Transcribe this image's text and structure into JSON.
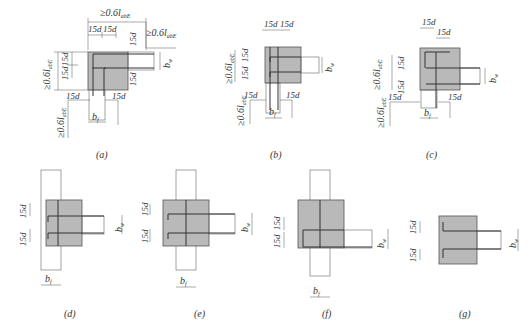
{
  "figure": {
    "panels": [
      {
        "id": "a",
        "caption": "(a)",
        "labels": {
          "top_anchor": "≥0.6l",
          "top_anchor_sub": "abE",
          "right_anchor": "≥0.6l",
          "right_anchor_sub": "abE",
          "left_anchor": "≥0.6l",
          "left_anchor_sub": "abE",
          "bottom_anchor": "≥0.6l",
          "bottom_anchor_sub": "abE",
          "hook": "15d",
          "bw": "b",
          "bw_sub": "w",
          "bf": "b",
          "bf_sub": "f"
        }
      },
      {
        "id": "b",
        "caption": "(b)",
        "labels": {
          "left_anchor": "≥0.6l",
          "left_anchor_sub": "abE",
          "bottom_anchor": "≥0.6l",
          "bottom_anchor_sub": "abE",
          "hook": "15d",
          "bw": "b",
          "bw_sub": "w",
          "bf": "b",
          "bf_sub": "f"
        }
      },
      {
        "id": "c",
        "caption": "(c)",
        "labels": {
          "left_anchor": "≥0.6l",
          "left_anchor_sub": "abE",
          "bottom_anchor": "≥0.6l",
          "bottom_anchor_sub": "abE",
          "hook": "15d",
          "bw": "b",
          "bw_sub": "w",
          "bf": "b",
          "bf_sub": "f"
        }
      },
      {
        "id": "d",
        "caption": "(d)",
        "labels": {
          "hook": "15d",
          "bw": "b",
          "bw_sub": "w",
          "bf": "b",
          "bf_sub": "f"
        }
      },
      {
        "id": "e",
        "caption": "(e)",
        "labels": {
          "hook": "15d",
          "bw": "b",
          "bw_sub": "w",
          "bf": "b",
          "bf_sub": "f"
        }
      },
      {
        "id": "f",
        "caption": "(f)",
        "labels": {
          "hook": "15d",
          "bw": "b",
          "bw_sub": "w",
          "bf": "b",
          "bf_sub": "f"
        }
      },
      {
        "id": "g",
        "caption": "(g)",
        "labels": {
          "hook": "15d",
          "bw": "b",
          "bw_sub": "w"
        }
      }
    ]
  }
}
